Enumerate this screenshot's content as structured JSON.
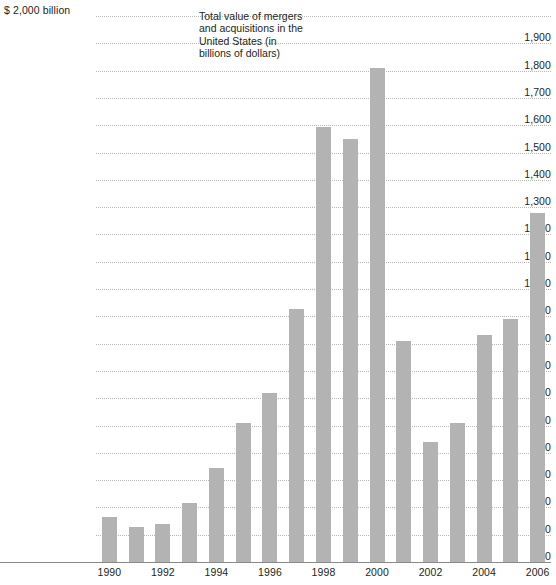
{
  "chart_data": {
    "type": "bar",
    "title": "Total value of mergers and acquisitions in the United States (in billions of dollars)",
    "note": "Total value of mergers and acquisitions in the United States (in billions of dollars)",
    "xlabel": "",
    "ylabel": "$ 2,000 billion",
    "ylim": [
      0,
      2000
    ],
    "ytick_step": 100,
    "grid": true,
    "legend": "none",
    "units": "billions of dollars",
    "bar_color": "#b3b3b3",
    "gridline_color": "#b9b9b9",
    "axis_color": "#8a8a8a",
    "text_color": "#231f20",
    "categories": [
      "1990",
      "1991",
      "1992",
      "1993",
      "1994",
      "1995",
      "1996",
      "1997",
      "1998",
      "1999",
      "2000",
      "2001",
      "2002",
      "2003",
      "2004",
      "2005",
      "2006"
    ],
    "values": [
      165,
      130,
      140,
      215,
      345,
      510,
      620,
      925,
      1595,
      1550,
      1810,
      810,
      440,
      510,
      830,
      890,
      1280
    ],
    "xtick_labels": [
      "1990",
      "1992",
      "1994",
      "1996",
      "1998",
      "2000",
      "2002",
      "2004",
      "2006"
    ],
    "ytick_labels": [
      "$ 2,000 billion",
      "1,900",
      "1,800",
      "1,700",
      "1,600",
      "1,500",
      "1,400",
      "1,300",
      "1,200",
      "1,100",
      "1,000",
      "900",
      "800",
      "700",
      "600",
      "500",
      "400",
      "300",
      "200",
      "100",
      "0"
    ],
    "ytick_values": [
      2000,
      1900,
      1800,
      1700,
      1600,
      1500,
      1400,
      1300,
      1200,
      1100,
      1000,
      900,
      800,
      700,
      600,
      500,
      400,
      300,
      200,
      100,
      0
    ]
  }
}
